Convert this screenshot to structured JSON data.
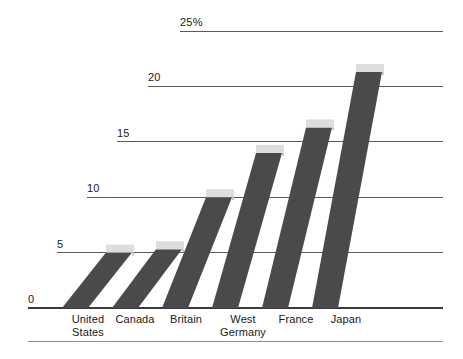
{
  "chart_data": {
    "type": "bar",
    "title": "",
    "subtitle": "",
    "xlabel": "",
    "ylabel": "",
    "unit": "%",
    "categories": [
      "United\nStates",
      "Canada",
      "Britain",
      "West\nGermany",
      "France",
      "Japan"
    ],
    "category_names": [
      "United States",
      "Canada",
      "Britain",
      "West Germany",
      "France",
      "Japan"
    ],
    "values": [
      5.0,
      5.3,
      10.0,
      14.0,
      16.3,
      21.3
    ],
    "series": [
      {
        "name": "",
        "values": [
          5.0,
          5.3,
          10.0,
          14.0,
          16.3,
          21.3
        ]
      }
    ],
    "ylim": [
      0,
      25
    ],
    "yticks": [
      0,
      5,
      10,
      15,
      20,
      25
    ],
    "ytick_labels": [
      "0",
      "5",
      "10",
      "15",
      "20",
      "25%"
    ],
    "grid": true,
    "grid_axis": "y",
    "legend": "none",
    "style": "slanted-3d-bars",
    "colors": {
      "bar_fill": "#4a4a4a",
      "bar_cap": "#dddddd",
      "gridline": "#5a5a5a",
      "baseline": "#3a3a3a",
      "background": "#ffffff",
      "text": "#1a1a1a"
    }
  }
}
